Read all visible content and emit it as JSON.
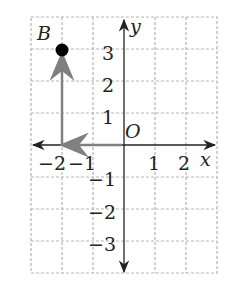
{
  "figure": {
    "axes": {
      "x_label": "x",
      "y_label": "y",
      "origin_label": "O"
    },
    "x_ticks": [
      "−2",
      "−1",
      "1",
      "2"
    ],
    "y_ticks": [
      "3",
      "2",
      "1",
      "−1",
      "−2",
      "−3"
    ],
    "point": {
      "label": "B",
      "x": -2,
      "y": 3
    },
    "path": "Arrows from origin left 2 units to (-2,0), then up 3 units to B(-2,3)",
    "colors": {
      "grid": "#b5b5b5",
      "axis": "#222222",
      "arrow": "#808080",
      "point": "#000000"
    }
  }
}
